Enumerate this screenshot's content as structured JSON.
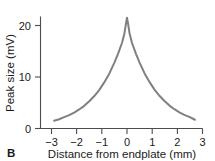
{
  "figure": {
    "panel_label": "B",
    "curve_color": "#808080",
    "axis_color": "#4d4d4d",
    "text_color": "#1a1a1a",
    "background_color": "#ffffff"
  },
  "chart_data": {
    "type": "line",
    "title": "",
    "xlabel": "Distance from endplate (mm)",
    "ylabel": "Peak size (mV)",
    "xlim": [
      -3,
      3
    ],
    "ylim": [
      0,
      23
    ],
    "grid": false,
    "legend": "none",
    "xticks": [
      -3,
      -2,
      -1,
      0,
      1,
      2,
      3
    ],
    "xtick_labels": [
      "−3",
      "−2",
      "−1",
      "0",
      "1",
      "2",
      "3"
    ],
    "yticks": [
      0,
      10,
      20
    ],
    "ytick_labels": [
      "0",
      "10",
      "20"
    ],
    "series": [
      {
        "name": "Peak endplate potential decay",
        "x": [
          -2.9,
          -2.7,
          -2.5,
          -2.3,
          -2.1,
          -1.9,
          -1.7,
          -1.5,
          -1.3,
          -1.1,
          -0.9,
          -0.7,
          -0.5,
          -0.35,
          -0.2,
          -0.1,
          -0.04,
          0,
          0.04,
          0.1,
          0.2,
          0.35,
          0.5,
          0.7,
          0.9,
          1.1,
          1.3,
          1.5,
          1.7,
          1.9,
          2.1,
          2.3,
          2.5,
          2.7
        ],
        "y": [
          1.5,
          1.8,
          2.2,
          2.6,
          3.1,
          3.7,
          4.4,
          5.3,
          6.3,
          7.5,
          9.0,
          10.7,
          12.8,
          14.6,
          16.6,
          18.5,
          20.4,
          21.5,
          20.4,
          18.5,
          16.6,
          14.6,
          12.8,
          10.7,
          9.0,
          7.5,
          6.3,
          5.3,
          4.4,
          3.7,
          3.1,
          2.6,
          2.2,
          1.7
        ]
      }
    ],
    "annotations": [
      {
        "text": "peak value at endplate",
        "x": 0,
        "y": 21.5
      }
    ]
  }
}
